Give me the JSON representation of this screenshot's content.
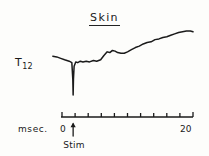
{
  "figure": {
    "title": "Skin",
    "y_axis_label_main": "T",
    "y_axis_label_sub": "12",
    "x_unit_label": "msec.",
    "x_tick_min_label": "0",
    "x_tick_max_label": "20",
    "stimulus_label": "Stim",
    "ink_color": "#1a1a1a",
    "background_color": "#fdfdfb"
  },
  "chart_data": {
    "type": "line",
    "title": "Skin",
    "xlabel": "msec.",
    "ylabel": "T12",
    "xlim": [
      0,
      20
    ],
    "grid": false,
    "legend": null,
    "annotations": [
      {
        "label": "Stim",
        "x": 1.7,
        "marker": "up-arrow"
      }
    ],
    "x_ticks": [
      0,
      2,
      4,
      6,
      8,
      10,
      12,
      14,
      16,
      18,
      20
    ],
    "x_tick_labels": [
      "0",
      "",
      "",
      "",
      "",
      "",
      "",
      "",
      "",
      "",
      "20"
    ],
    "series": [
      {
        "name": "T12 skin response",
        "comment": "y values are relative trace amplitude in arbitrary units; higher = upward on plot",
        "x": [
          -1.4,
          -0.8,
          -0.2,
          0.4,
          1.1,
          1.5,
          1.65,
          1.7,
          1.75,
          1.85,
          2.1,
          2.4,
          2.8,
          3.2,
          3.7,
          4.2,
          4.8,
          5.3,
          5.9,
          6.4,
          6.9,
          7.3,
          7.7,
          8.1,
          8.5,
          9.0,
          9.5,
          10.0,
          10.6,
          11.2,
          11.8,
          12.4,
          13.0,
          13.6,
          14.2,
          14.8,
          15.4,
          16.0,
          16.6,
          17.2,
          17.8,
          18.4,
          19.0,
          19.6,
          20.0
        ],
        "y": [
          62,
          61,
          59,
          57,
          55,
          53,
          30,
          8,
          30,
          48,
          54,
          53,
          55,
          54,
          55,
          54,
          56,
          55,
          57,
          63,
          68,
          67,
          70,
          69,
          67,
          66,
          66,
          68,
          71,
          74,
          76,
          79,
          81,
          82,
          85,
          86,
          88,
          89,
          91,
          93,
          95,
          96,
          97,
          97,
          96
        ]
      }
    ]
  }
}
